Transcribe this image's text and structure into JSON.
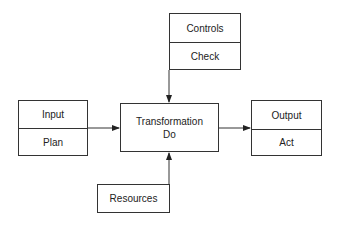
{
  "diagram": {
    "type": "process-flow",
    "nodes": {
      "controls": {
        "top": "Controls",
        "bottom": "Check"
      },
      "input": {
        "top": "Input",
        "bottom": "Plan"
      },
      "transformation": {
        "line1": "Transformation",
        "line2": "Do"
      },
      "output": {
        "top": "Output",
        "bottom": "Act"
      },
      "resources": {
        "label": "Resources"
      }
    },
    "edges": [
      {
        "from": "controls",
        "to": "transformation"
      },
      {
        "from": "input",
        "to": "transformation"
      },
      {
        "from": "transformation",
        "to": "output"
      },
      {
        "from": "resources",
        "to": "transformation"
      }
    ],
    "colors": {
      "stroke": "#333333",
      "background": "#ffffff"
    }
  }
}
